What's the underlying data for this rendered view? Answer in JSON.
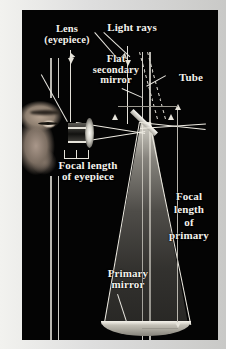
{
  "figure": {
    "title_alt": "Newtonian reflecting telescope ray diagram",
    "background_color": "#040404",
    "border_color": "#e9e9e6",
    "line_color": "#cfcdc6"
  },
  "labels": {
    "lens": "Lens",
    "lens_sub": "(eyepiece)",
    "light_rays": "Light rays",
    "flat_secondary_l1": "Flat",
    "flat_secondary_l2": "secondary",
    "flat_secondary_l3": "mirror",
    "tube": "Tube",
    "focal_eyepiece_l1": "Focal length",
    "focal_eyepiece_l2": "of eyepiece",
    "focal_primary_l1": "Focal",
    "focal_primary_l2": "length",
    "focal_primary_l3": "of",
    "focal_primary_l4": "primary",
    "primary_mirror_l1": "Primary",
    "primary_mirror_l2": "mirror"
  },
  "parts": {
    "eye": "observer-eye",
    "eyepiece_lens": "eyepiece-lens",
    "secondary_mirror": "flat-secondary-mirror",
    "primary_mirror": "primary-mirror",
    "tube_walls": "telescope-tube",
    "light_cone": "converging-light-cone",
    "incoming_rays": "incoming-parallel-light-rays"
  },
  "measurements": {
    "focal_length_eyepiece": "Focal length of eyepiece",
    "focal_length_primary": "Focal length of primary"
  }
}
